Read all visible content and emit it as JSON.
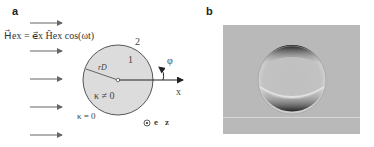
{
  "panel_a": {
    "label": "a",
    "equation": "H⃗ex = e⃗x Ĥex cos(ωt)",
    "region_inner_label": "1",
    "region_outer_label": "2",
    "radius_label": "rD",
    "inner_kappa": "κ ≠ 0",
    "outer_kappa": "κ = 0",
    "angle_label": "φ",
    "axis_label": "x",
    "unit_vector_label": "e⃗z",
    "field_arrow_count": 5,
    "colors": {
      "disk_fill": "#dcdcdc",
      "disk_stroke": "#555555",
      "arrow": "#666666"
    }
  },
  "panel_b": {
    "label": "b",
    "description": "grayscale micrograph of circular droplet",
    "colors": {
      "background": "#b9b9b9"
    }
  }
}
